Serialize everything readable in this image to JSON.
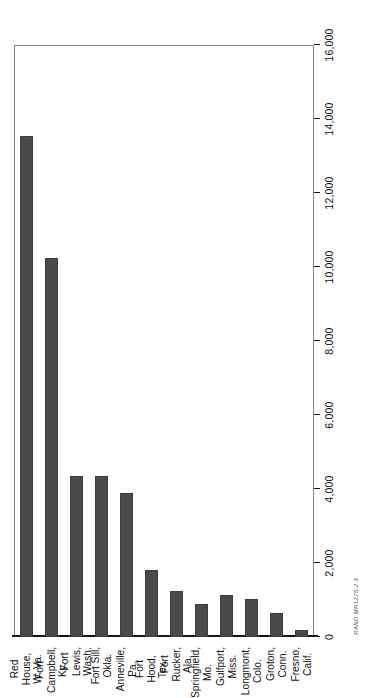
{
  "figure": {
    "source_id": "RAND MR1275-2.3"
  },
  "chart_data": {
    "type": "bar",
    "orientation": "horizontal",
    "title": "",
    "subtitle": "",
    "xlabel": "",
    "ylabel": "",
    "xlim": [
      0,
      16000
    ],
    "grid": false,
    "legend": null,
    "bar_color": "#4a4a4a",
    "axis_color": "#141414",
    "categories": [
      "Red House,\nW. Va.",
      "Fort\nCampbell,\nKy.",
      "Fort\nLewis,\nWash.",
      "Fort Sill,\nOkla.",
      "Anneville,\nPa.",
      "Fort Hood,\nTex.",
      "Fort\nRucker,\nAla.",
      "Springfield,\nMo.",
      "Gulfport,\nMiss.",
      "Longmont,\nColo.",
      "Groton,\nConn.",
      "Fresno,\nCalif."
    ],
    "values": [
      13550,
      10250,
      4350,
      4350,
      3900,
      1800,
      1250,
      900,
      1130,
      1030,
      650,
      200
    ],
    "tick_values": [
      0,
      2000,
      4000,
      6000,
      8000,
      10000,
      12000,
      14000,
      16000
    ],
    "tick_labels": [
      "0",
      "2,000",
      "4,000",
      "6,000",
      "8,000",
      "10,000",
      "12,000",
      "14,000",
      "16,000"
    ]
  }
}
